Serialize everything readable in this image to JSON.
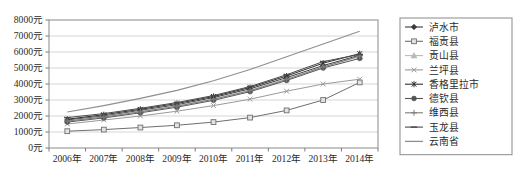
{
  "chart_data": {
    "type": "line",
    "title": "",
    "xlabel": "",
    "ylabel": "",
    "ylim": [
      0,
      8000
    ],
    "grid": true,
    "legend_position": "right",
    "categories": [
      "2006年",
      "2007年",
      "2008年",
      "2009年",
      "2010年",
      "2011年",
      "2012年",
      "2013年",
      "2014年"
    ],
    "ytick_labels": [
      "0元",
      "1000元",
      "2000元",
      "3000元",
      "4000元",
      "5000元",
      "6000元",
      "7000元",
      "8000元"
    ],
    "ytick_values": [
      0,
      1000,
      2000,
      3000,
      4000,
      5000,
      6000,
      7000,
      8000
    ],
    "series": [
      {
        "name": "泸水市",
        "marker": "diamond",
        "color": "#3a3a3a",
        "values": [
          1750,
          2000,
          2350,
          2700,
          3150,
          3700,
          4400,
          5150,
          5800
        ]
      },
      {
        "name": "福贡县",
        "marker": "square",
        "color": "#6f6f6f",
        "values": [
          1050,
          1150,
          1280,
          1420,
          1620,
          1900,
          2350,
          3000,
          4100
        ]
      },
      {
        "name": "贡山县",
        "marker": "triangle",
        "color": "#b9b9b9",
        "values": [
          1700,
          1960,
          2300,
          2650,
          3080,
          3620,
          4320,
          5080,
          5700
        ]
      },
      {
        "name": "兰坪县",
        "marker": "cross",
        "color": "#9a9a9a",
        "values": [
          1500,
          1750,
          2000,
          2300,
          2650,
          3050,
          3550,
          4000,
          4300
        ]
      },
      {
        "name": "香格里拉市",
        "marker": "asterisk",
        "color": "#2f2f2f",
        "values": [
          1800,
          2080,
          2420,
          2780,
          3220,
          3780,
          4500,
          5300,
          5900
        ]
      },
      {
        "name": "德钦县",
        "marker": "circle",
        "color": "#555555",
        "values": [
          1620,
          1880,
          2200,
          2550,
          2980,
          3520,
          4220,
          5000,
          5600
        ]
      },
      {
        "name": "维西县",
        "marker": "plus",
        "color": "#7d7d7d",
        "values": [
          1680,
          1930,
          2260,
          2610,
          3040,
          3580,
          4280,
          5060,
          5750
        ]
      },
      {
        "name": "玉龙县",
        "marker": "dash",
        "color": "#4a4a4a",
        "values": [
          1900,
          2150,
          2480,
          2840,
          3280,
          3840,
          4580,
          5400,
          5850
        ]
      },
      {
        "name": "云南省",
        "marker": "line",
        "color": "#8f8f8f",
        "values": [
          2250,
          2650,
          3100,
          3600,
          4200,
          4900,
          5700,
          6500,
          7300
        ]
      }
    ]
  }
}
